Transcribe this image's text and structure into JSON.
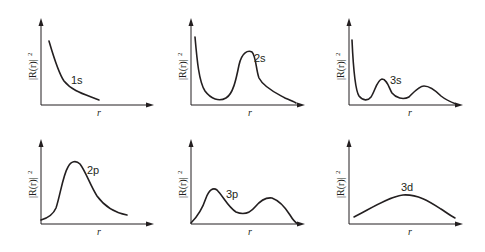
{
  "common": {
    "y_axis_label": "|R(r)|²",
    "y_axis_text": "|R(r)|",
    "y_axis_sup": "2",
    "x_axis_label": "r"
  },
  "panels": [
    {
      "id": "1s",
      "label": "1s",
      "row": 1,
      "col": 1,
      "peaks": 0,
      "description": "monotonically decreasing from r=0"
    },
    {
      "id": "2s",
      "label": "2s",
      "row": 1,
      "col": 2,
      "peaks": 1,
      "description": "high at r=0, dips to a node, then one large peak"
    },
    {
      "id": "3s",
      "label": "3s",
      "row": 1,
      "col": 3,
      "peaks": 2,
      "description": "high at r=0, two subsequent peaks"
    },
    {
      "id": "2p",
      "label": "2p",
      "row": 2,
      "col": 1,
      "peaks": 1,
      "description": "starts near zero, single peak"
    },
    {
      "id": "3p",
      "label": "3p",
      "row": 2,
      "col": 2,
      "peaks": 2,
      "description": "starts at zero, two peaks"
    },
    {
      "id": "3d",
      "label": "3d",
      "row": 2,
      "col": 3,
      "peaks": 1,
      "description": "broad single low hump"
    }
  ]
}
